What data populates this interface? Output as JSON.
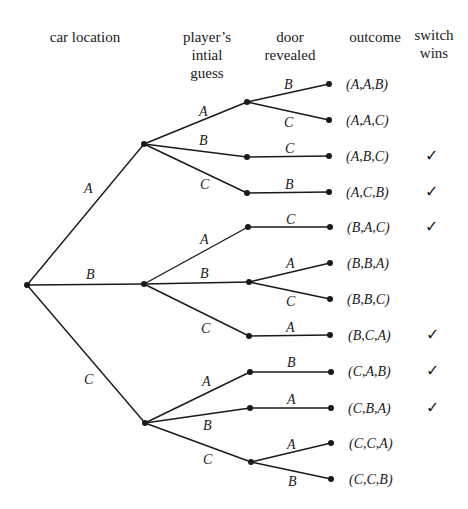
{
  "headers": {
    "car_location": "car location",
    "player_guess": [
      "player’s",
      "intial",
      "guess"
    ],
    "door_revealed": [
      "door",
      "revealed"
    ],
    "outcome": "outcome",
    "switch_wins": [
      "switch",
      "wins"
    ]
  },
  "tree": {
    "root": "start",
    "car_location_branches": [
      "A",
      "B",
      "C"
    ],
    "guess_branches": {
      "A": [
        "A",
        "B",
        "C"
      ],
      "B": [
        "A",
        "B",
        "C"
      ],
      "C": [
        "A",
        "B",
        "C"
      ]
    },
    "revealed_branches": {
      "A-A": [
        "B",
        "C"
      ],
      "A-B": [
        "C"
      ],
      "A-C": [
        "B"
      ],
      "B-A": [
        "C"
      ],
      "B-B": [
        "A",
        "C"
      ],
      "B-C": [
        "A"
      ],
      "C-A": [
        "B"
      ],
      "C-B": [
        "A"
      ],
      "C-C": [
        "A",
        "B"
      ]
    }
  },
  "outcomes": [
    {
      "label": "(A,A,B)",
      "switch_wins": false
    },
    {
      "label": "(A,A,C)",
      "switch_wins": false
    },
    {
      "label": "(A,B,C)",
      "switch_wins": true
    },
    {
      "label": "(A,C,B)",
      "switch_wins": true
    },
    {
      "label": "(B,A,C)",
      "switch_wins": true
    },
    {
      "label": "(B,B,A)",
      "switch_wins": false
    },
    {
      "label": "(B,B,C)",
      "switch_wins": false
    },
    {
      "label": "(B,C,A)",
      "switch_wins": true
    },
    {
      "label": "(C,A,B)",
      "switch_wins": true
    },
    {
      "label": "(C,B,A)",
      "switch_wins": true
    },
    {
      "label": "(C,C,A)",
      "switch_wins": false
    },
    {
      "label": "(C,C,B)",
      "switch_wins": false
    }
  ],
  "check_glyph": "✓"
}
